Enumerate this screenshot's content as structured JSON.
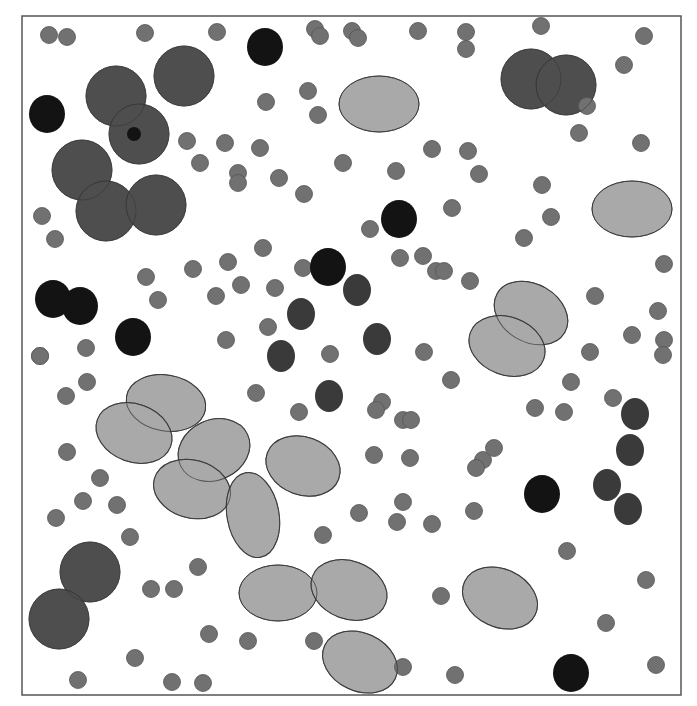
{
  "canvas": {
    "width": 697,
    "height": 706,
    "background": "#ffffff"
  },
  "frame": {
    "x": 22,
    "y": 16,
    "width": 659,
    "height": 679,
    "stroke": "#555555",
    "stroke_width": 1.5
  },
  "colors": {
    "small": "#717171",
    "large": "#4e4e4e",
    "black": "#131313",
    "darkblob": "#3a3a3a",
    "ellipse": "#a9a9a9",
    "outline": "#333333"
  },
  "shapes": {
    "large_circles": [
      {
        "cx": 116,
        "cy": 96,
        "r": 30
      },
      {
        "cx": 184,
        "cy": 76,
        "r": 30
      },
      {
        "cx": 139,
        "cy": 134,
        "r": 30
      },
      {
        "cx": 82,
        "cy": 170,
        "r": 30
      },
      {
        "cx": 106,
        "cy": 211,
        "r": 30
      },
      {
        "cx": 156,
        "cy": 205,
        "r": 30
      },
      {
        "cx": 531,
        "cy": 79,
        "r": 30
      },
      {
        "cx": 566,
        "cy": 85,
        "r": 30
      },
      {
        "cx": 90,
        "cy": 572,
        "r": 30
      },
      {
        "cx": 59,
        "cy": 619,
        "r": 30
      }
    ],
    "black_circles": [
      {
        "cx": 265,
        "cy": 47,
        "rx": 18,
        "ry": 19
      },
      {
        "cx": 47,
        "cy": 114,
        "rx": 18,
        "ry": 19
      },
      {
        "cx": 399,
        "cy": 219,
        "rx": 18,
        "ry": 19
      },
      {
        "cx": 328,
        "cy": 267,
        "rx": 18,
        "ry": 19
      },
      {
        "cx": 53,
        "cy": 299,
        "rx": 18,
        "ry": 19
      },
      {
        "cx": 80,
        "cy": 306,
        "rx": 18,
        "ry": 19
      },
      {
        "cx": 133,
        "cy": 337,
        "rx": 18,
        "ry": 19
      },
      {
        "cx": 542,
        "cy": 494,
        "rx": 18,
        "ry": 19
      },
      {
        "cx": 571,
        "cy": 673,
        "rx": 18,
        "ry": 19
      },
      {
        "cx": 134,
        "cy": 134,
        "rx": 7,
        "ry": 7
      }
    ],
    "dark_blobs": [
      {
        "cx": 357,
        "cy": 290,
        "rx": 14,
        "ry": 16
      },
      {
        "cx": 301,
        "cy": 314,
        "rx": 14,
        "ry": 16
      },
      {
        "cx": 377,
        "cy": 339,
        "rx": 14,
        "ry": 16
      },
      {
        "cx": 281,
        "cy": 356,
        "rx": 14,
        "ry": 16
      },
      {
        "cx": 329,
        "cy": 396,
        "rx": 14,
        "ry": 16
      },
      {
        "cx": 635,
        "cy": 414,
        "rx": 14,
        "ry": 16
      },
      {
        "cx": 630,
        "cy": 450,
        "rx": 14,
        "ry": 16
      },
      {
        "cx": 607,
        "cy": 485,
        "rx": 14,
        "ry": 16
      },
      {
        "cx": 628,
        "cy": 509,
        "rx": 14,
        "ry": 16
      }
    ],
    "ellipses": [
      {
        "cx": 379,
        "cy": 104,
        "rx": 40,
        "ry": 28,
        "rot": 0
      },
      {
        "cx": 632,
        "cy": 209,
        "rx": 40,
        "ry": 28,
        "rot": 0
      },
      {
        "cx": 531,
        "cy": 313,
        "rx": 39,
        "ry": 29,
        "rot": 30
      },
      {
        "cx": 507,
        "cy": 346,
        "rx": 39,
        "ry": 29,
        "rot": 20
      },
      {
        "cx": 166,
        "cy": 403,
        "rx": 40,
        "ry": 28,
        "rot": 10
      },
      {
        "cx": 134,
        "cy": 433,
        "rx": 39,
        "ry": 29,
        "rot": 20
      },
      {
        "cx": 214,
        "cy": 450,
        "rx": 37,
        "ry": 30,
        "rot": -25
      },
      {
        "cx": 192,
        "cy": 489,
        "rx": 39,
        "ry": 29,
        "rot": 15
      },
      {
        "cx": 303,
        "cy": 466,
        "rx": 38,
        "ry": 29,
        "rot": 20
      },
      {
        "cx": 253,
        "cy": 515,
        "rx": 26,
        "ry": 43,
        "rot": -10
      },
      {
        "cx": 278,
        "cy": 593,
        "rx": 39,
        "ry": 28,
        "rot": 0
      },
      {
        "cx": 349,
        "cy": 590,
        "rx": 39,
        "ry": 29,
        "rot": 20
      },
      {
        "cx": 500,
        "cy": 598,
        "rx": 39,
        "ry": 29,
        "rot": 25
      },
      {
        "cx": 360,
        "cy": 662,
        "rx": 39,
        "ry": 29,
        "rot": 25
      }
    ],
    "small_circles": [
      [
        49,
        35
      ],
      [
        67,
        37
      ],
      [
        145,
        33
      ],
      [
        217,
        32
      ],
      [
        315,
        29
      ],
      [
        320,
        36
      ],
      [
        352,
        31
      ],
      [
        358,
        38
      ],
      [
        418,
        31
      ],
      [
        466,
        32
      ],
      [
        466,
        49
      ],
      [
        541,
        26
      ],
      [
        644,
        36
      ],
      [
        624,
        65
      ],
      [
        587,
        106
      ],
      [
        579,
        133
      ],
      [
        641,
        143
      ],
      [
        266,
        102
      ],
      [
        308,
        91
      ],
      [
        318,
        115
      ],
      [
        187,
        141
      ],
      [
        225,
        143
      ],
      [
        260,
        148
      ],
      [
        200,
        163
      ],
      [
        238,
        173
      ],
      [
        238,
        183
      ],
      [
        279,
        178
      ],
      [
        304,
        194
      ],
      [
        343,
        163
      ],
      [
        396,
        171
      ],
      [
        432,
        149
      ],
      [
        468,
        151
      ],
      [
        479,
        174
      ],
      [
        542,
        185
      ],
      [
        551,
        217
      ],
      [
        524,
        238
      ],
      [
        452,
        208
      ],
      [
        42,
        216
      ],
      [
        55,
        239
      ],
      [
        370,
        229
      ],
      [
        400,
        258
      ],
      [
        263,
        248
      ],
      [
        228,
        262
      ],
      [
        193,
        269
      ],
      [
        146,
        277
      ],
      [
        158,
        300
      ],
      [
        216,
        296
      ],
      [
        241,
        285
      ],
      [
        275,
        288
      ],
      [
        303,
        268
      ],
      [
        423,
        256
      ],
      [
        436,
        271
      ],
      [
        444,
        271
      ],
      [
        470,
        281
      ],
      [
        595,
        296
      ],
      [
        664,
        264
      ],
      [
        658,
        311
      ],
      [
        632,
        335
      ],
      [
        664,
        340
      ],
      [
        663,
        355
      ],
      [
        40,
        356
      ],
      [
        86,
        348
      ],
      [
        226,
        340
      ],
      [
        268,
        327
      ],
      [
        330,
        354
      ],
      [
        424,
        352
      ],
      [
        590,
        352
      ],
      [
        571,
        382
      ],
      [
        613,
        398
      ],
      [
        564,
        412
      ],
      [
        66,
        396
      ],
      [
        87,
        382
      ],
      [
        256,
        393
      ],
      [
        299,
        412
      ],
      [
        382,
        402
      ],
      [
        376,
        410
      ],
      [
        403,
        420
      ],
      [
        411,
        420
      ],
      [
        451,
        380
      ],
      [
        535,
        408
      ],
      [
        67,
        452
      ],
      [
        100,
        478
      ],
      [
        83,
        501
      ],
      [
        117,
        505
      ],
      [
        130,
        537
      ],
      [
        56,
        518
      ],
      [
        374,
        455
      ],
      [
        410,
        458
      ],
      [
        483,
        460
      ],
      [
        494,
        448
      ],
      [
        476,
        468
      ],
      [
        359,
        513
      ],
      [
        403,
        502
      ],
      [
        397,
        522
      ],
      [
        432,
        524
      ],
      [
        474,
        511
      ],
      [
        567,
        551
      ],
      [
        323,
        535
      ],
      [
        151,
        589
      ],
      [
        174,
        589
      ],
      [
        198,
        567
      ],
      [
        441,
        596
      ],
      [
        646,
        580
      ],
      [
        606,
        623
      ],
      [
        209,
        634
      ],
      [
        248,
        641
      ],
      [
        314,
        641
      ],
      [
        403,
        667
      ],
      [
        455,
        675
      ],
      [
        656,
        665
      ],
      [
        135,
        658
      ],
      [
        78,
        680
      ],
      [
        172,
        682
      ],
      [
        203,
        683
      ],
      [
        40,
        356
      ]
    ]
  }
}
